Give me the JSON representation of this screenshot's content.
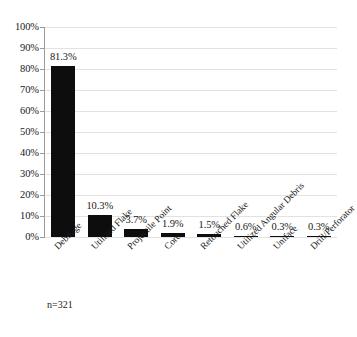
{
  "chart_data": {
    "type": "bar",
    "title": "",
    "subtitle": "",
    "xlabel": "",
    "ylabel": "",
    "categories": [
      "Debitage",
      "Utilized Flake",
      "Projectile Point",
      "Core",
      "Retouched Flake",
      "Utilized Angular Debris",
      "Uniface",
      "Drill/Perforator"
    ],
    "values": [
      81.3,
      10.3,
      3.7,
      1.9,
      1.5,
      0.6,
      0.3,
      0.3
    ],
    "value_labels": [
      "81.3%",
      "10.3%",
      "3.7%",
      "1.9%",
      "1.5%",
      "0.6%",
      "0.3%",
      "0.3%"
    ],
    "ylim": [
      0,
      100
    ],
    "ytick_values": [
      0,
      10,
      20,
      30,
      40,
      50,
      60,
      70,
      80,
      90,
      100
    ],
    "ytick_labels": [
      "0%",
      "10%",
      "20%",
      "30%",
      "40%",
      "50%",
      "60%",
      "70%",
      "80%",
      "90%",
      "100%"
    ],
    "grid": true,
    "legend": "none",
    "bar_color": "#0d0d0d",
    "gridline_color": "#e2e2e2",
    "axis_color": "#9a9a9a"
  },
  "annotations": {
    "sample_size": "n=321"
  }
}
